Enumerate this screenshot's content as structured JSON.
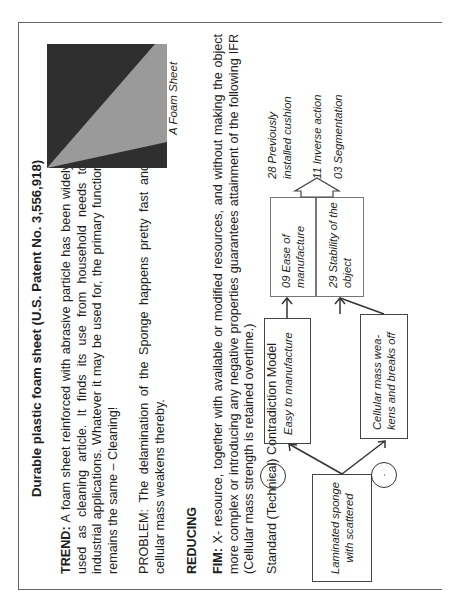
{
  "document": {
    "title": "Durable plastic foam sheet (U.S. Patent No. 3,556,918)",
    "trend_label": "TREND:",
    "trend_text": " A foam sheet reinforced with abrasive particle has been widely used as cleaning article. It finds its use from household needs to industrial applications. Whatever it may be used for, the primary function remains the same – Cleaning!",
    "problem_text": "PROBLEM: The delamination of the Sponge happens pretty fast and cellular mass weakens thereby.",
    "reducing_heading": "REDUCING",
    "fim_label": "FIM:",
    "fim_text": " X- resource, together with available or modified resources, and without making the object more complex or introducing any negative properties guarantees attainment of the following IFR (Cellular mass strength is retained overtime.)",
    "model_heading": "Standard (Technical) Contradiction Model",
    "figure_caption": "A Foam Sheet",
    "figure_colors": {
      "background": "#2f2f2f",
      "foam": "#9a9a9a"
    }
  },
  "diagram": {
    "source_box": "Laminated sponge with scattered",
    "positive_sign": "+",
    "negative_sign": "-",
    "positive_effect": "Easy to manufacture",
    "negative_effect": "Cellular mass wea-kens and breaks off",
    "improving_parameter": "09 Ease of manufacture",
    "worsening_parameter": "29 Stability of the object",
    "principles": [
      "28 Previously installed cushion",
      "11 Inverse action",
      "03 Segmentation"
    ]
  }
}
